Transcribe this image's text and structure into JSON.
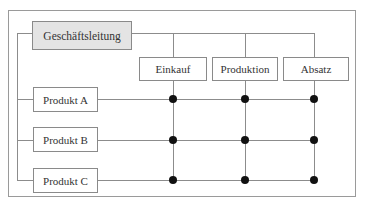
{
  "diagram": {
    "management": {
      "label": "Geschäftsleitung",
      "fill": "#e4e4e4"
    },
    "functions": [
      {
        "label": "Einkauf"
      },
      {
        "label": "Produktion"
      },
      {
        "label": "Absatz"
      }
    ],
    "products": [
      {
        "label": "Produkt A"
      },
      {
        "label": "Produkt B"
      },
      {
        "label": "Produkt C"
      }
    ],
    "colors": {
      "line": "#8c8c8c",
      "node": "#111111",
      "border": "#8a8a8a"
    }
  }
}
